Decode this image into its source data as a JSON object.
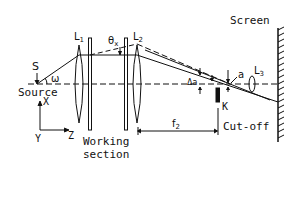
{
  "diagram": {
    "type": "schlieren optical setup",
    "colors": {
      "ink": "#111111",
      "background": "#ffffff"
    },
    "labels": {
      "screen": "Screen",
      "source": "Source",
      "source_point": "S",
      "omega": "ω",
      "lens1": "L",
      "lens1_sub": "1",
      "lens2": "L",
      "lens2_sub": "2",
      "lens3": "L",
      "lens3_sub": "3",
      "theta": "θ",
      "theta_sub": "x",
      "delta_a": "Δa",
      "a": "a",
      "k": "K",
      "cutoff": "Cut-off",
      "working_line1": "Working",
      "working_line2": "section",
      "f2": "f",
      "f2_sub": "2",
      "axis_x": "X",
      "axis_y": "Y",
      "axis_z": "Z"
    },
    "components": [
      {
        "name": "Source S",
        "x": 37
      },
      {
        "name": "Lens L1",
        "x": 79
      },
      {
        "name": "Working section window 1",
        "x": 90
      },
      {
        "name": "Working section window 2",
        "x": 126
      },
      {
        "name": "Lens L2",
        "x": 137
      },
      {
        "name": "Knife edge K (cut-off)",
        "x": 218
      },
      {
        "name": "Lens L3",
        "x": 252
      },
      {
        "name": "Screen",
        "x": 278
      }
    ]
  }
}
